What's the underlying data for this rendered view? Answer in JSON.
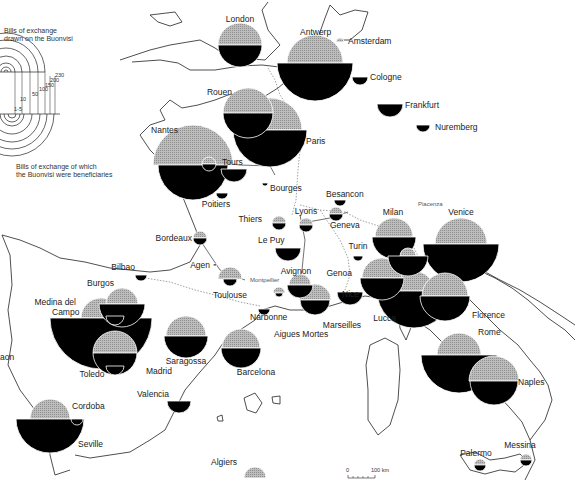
{
  "legend": {
    "top_title_line1": "Bills of exchange",
    "top_title_line2": "drawn on the Buonvisi",
    "bottom_title_line1": "Bills of exchange of which",
    "bottom_title_line2": "the Buonvisi were beneficiaries",
    "scale_values": [
      "1-5",
      "10",
      "50",
      "100",
      "150",
      "200",
      "230"
    ]
  },
  "scale_bar": {
    "start": "0",
    "end": "100 km"
  },
  "colors": {
    "drawn_on": "#a8a8a8",
    "beneficiaries": "#000000"
  },
  "cities": [
    {
      "name": "London",
      "x": 240,
      "y": 45,
      "drawn_r": 22,
      "benef_r": 22,
      "lx": 240,
      "ly": 22,
      "anchor": "middle"
    },
    {
      "name": "Antwerp",
      "x": 315,
      "y": 63,
      "drawn_r": 28,
      "benef_r": 38,
      "lx": 300,
      "ly": 35,
      "anchor": "start"
    },
    {
      "name": "Amsterdam",
      "x": 340,
      "y": 42,
      "drawn_r": 4,
      "benef_r": 0,
      "lx": 348,
      "ly": 44,
      "anchor": "start"
    },
    {
      "name": "Cologne",
      "x": 360,
      "y": 77,
      "drawn_r": 0,
      "benef_r": 8,
      "lx": 370,
      "ly": 80,
      "anchor": "start"
    },
    {
      "name": "Frankfurt",
      "x": 390,
      "y": 104,
      "drawn_r": 0,
      "benef_r": 13,
      "lx": 405,
      "ly": 108,
      "anchor": "start"
    },
    {
      "name": "Nuremberg",
      "x": 423,
      "y": 125,
      "drawn_r": 0,
      "benef_r": 7,
      "lx": 435,
      "ly": 130,
      "anchor": "start"
    },
    {
      "name": "Rouen",
      "x": 248,
      "y": 113,
      "drawn_r": 25,
      "benef_r": 25,
      "lx": 232,
      "ly": 95,
      "anchor": "end"
    },
    {
      "name": "Paris",
      "x": 270,
      "y": 130,
      "drawn_r": 32,
      "benef_r": 37,
      "lx": 306,
      "ly": 144,
      "anchor": "start"
    },
    {
      "name": "Nantes",
      "x": 193,
      "y": 165,
      "drawn_r": 40,
      "benef_r": 35,
      "lx": 178,
      "ly": 133,
      "anchor": "end"
    },
    {
      "name": "Tours",
      "x": 209,
      "y": 164,
      "drawn_r": 7,
      "benef_r": 7,
      "lx": 222,
      "ly": 165,
      "anchor": "start"
    },
    {
      "name": "Tours-2",
      "x": 234,
      "y": 169,
      "drawn_r": 0,
      "benef_r": 13,
      "lx": 0,
      "ly": 0,
      "anchor": "start"
    },
    {
      "name": "Poitiers",
      "x": 222,
      "y": 193,
      "drawn_r": 0,
      "benef_r": 6,
      "lx": 216,
      "ly": 207,
      "anchor": "middle"
    },
    {
      "name": "Bourges",
      "x": 265,
      "y": 183,
      "drawn_r": 0,
      "benef_r": 3,
      "lx": 270,
      "ly": 191,
      "anchor": "start"
    },
    {
      "name": "Besancon",
      "x": 340,
      "y": 200,
      "drawn_r": 0,
      "benef_r": 6,
      "lx": 326,
      "ly": 197,
      "anchor": "start"
    },
    {
      "name": "Thiers",
      "x": 279,
      "y": 223,
      "drawn_r": 7,
      "benef_r": 7,
      "lx": 262,
      "ly": 222,
      "anchor": "end"
    },
    {
      "name": "Lyons",
      "x": 306,
      "y": 225,
      "drawn_r": 7,
      "benef_r": 7,
      "lx": 306,
      "ly": 214,
      "anchor": "middle"
    },
    {
      "name": "Geneva",
      "x": 336,
      "y": 214,
      "drawn_r": 7,
      "benef_r": 7,
      "lx": 330,
      "ly": 228,
      "anchor": "start"
    },
    {
      "name": "Le Puy",
      "x": 288,
      "y": 248,
      "drawn_r": 0,
      "benef_r": 13,
      "lx": 258,
      "ly": 243,
      "anchor": "start"
    },
    {
      "name": "Bordeaux",
      "x": 200,
      "y": 238,
      "drawn_r": 7,
      "benef_r": 7,
      "lx": 192,
      "ly": 241,
      "anchor": "end"
    },
    {
      "name": "Agen",
      "x": 215,
      "y": 264,
      "drawn_r": 0,
      "benef_r": 2,
      "lx": 210,
      "ly": 268,
      "anchor": "end"
    },
    {
      "name": "Bilbao",
      "x": 141,
      "y": 275,
      "drawn_r": 0,
      "benef_r": 6,
      "lx": 135,
      "ly": 270,
      "anchor": "end"
    },
    {
      "name": "Toulouse",
      "x": 230,
      "y": 279,
      "drawn_r": 12,
      "benef_r": 7,
      "lx": 230,
      "ly": 298,
      "anchor": "middle"
    },
    {
      "name": "Montpellier",
      "x": 279,
      "y": 293,
      "drawn_r": 6,
      "benef_r": 4,
      "lx": 250,
      "ly": 282,
      "anchor": "start"
    },
    {
      "name": "Narbonne",
      "x": 264,
      "y": 309,
      "drawn_r": 0,
      "benef_r": 6,
      "lx": 250,
      "ly": 320,
      "anchor": "start"
    },
    {
      "name": "Avignon",
      "x": 300,
      "y": 285,
      "drawn_r": 11,
      "benef_r": 13,
      "lx": 296,
      "ly": 274,
      "anchor": "middle"
    },
    {
      "name": "Marseilles",
      "x": 315,
      "y": 300,
      "drawn_r": 16,
      "benef_r": 15,
      "lx": 342,
      "ly": 328,
      "anchor": "middle"
    },
    {
      "name": "Aigues Mortes",
      "x": 0,
      "y": 0,
      "drawn_r": 0,
      "benef_r": 0,
      "lx": 274,
      "ly": 337,
      "anchor": "start"
    },
    {
      "name": "Turin",
      "x": 358,
      "y": 256,
      "drawn_r": 0,
      "benef_r": 5,
      "lx": 358,
      "ly": 249,
      "anchor": "middle"
    },
    {
      "name": "Genoa",
      "x": 382,
      "y": 278,
      "drawn_r": 20,
      "benef_r": 22,
      "lx": 352,
      "ly": 276,
      "anchor": "end"
    },
    {
      "name": "Nice",
      "x": 350,
      "y": 292,
      "drawn_r": 0,
      "benef_r": 13,
      "lx": 342,
      "ly": 297,
      "anchor": "start"
    },
    {
      "name": "Milan",
      "x": 394,
      "y": 237,
      "drawn_r": 19,
      "benef_r": 22,
      "lx": 393,
      "ly": 215,
      "anchor": "middle"
    },
    {
      "name": "Piacenza",
      "x": 408,
      "y": 256,
      "drawn_r": 8,
      "benef_r": 20,
      "lx": 418,
      "ly": 206,
      "anchor": "start"
    },
    {
      "name": "Venice",
      "x": 461,
      "y": 244,
      "drawn_r": 26,
      "benef_r": 38,
      "lx": 461,
      "ly": 215,
      "anchor": "middle"
    },
    {
      "name": "Lucca",
      "x": 414,
      "y": 291,
      "drawn_r": 20,
      "benef_r": 37,
      "lx": 396,
      "ly": 321,
      "anchor": "end"
    },
    {
      "name": "Florence",
      "x": 445,
      "y": 296,
      "drawn_r": 23,
      "benef_r": 25,
      "lx": 472,
      "ly": 318,
      "anchor": "start"
    },
    {
      "name": "Rome",
      "x": 459,
      "y": 355,
      "drawn_r": 22,
      "benef_r": 38,
      "lx": 478,
      "ly": 335,
      "anchor": "start"
    },
    {
      "name": "Naples",
      "x": 494,
      "y": 381,
      "drawn_r": 25,
      "benef_r": 24,
      "lx": 518,
      "ly": 385,
      "anchor": "start"
    },
    {
      "name": "Palermo",
      "x": 480,
      "y": 465,
      "drawn_r": 6,
      "benef_r": 6,
      "lx": 476,
      "ly": 456,
      "anchor": "middle"
    },
    {
      "name": "Messina",
      "x": 526,
      "y": 460,
      "drawn_r": 6,
      "benef_r": 6,
      "lx": 520,
      "ly": 448,
      "anchor": "middle"
    },
    {
      "name": "Burgos",
      "x": 122,
      "y": 304,
      "drawn_r": 16,
      "benef_r": 23,
      "lx": 114,
      "ly": 286,
      "anchor": "end"
    },
    {
      "name": "Burgos-inner",
      "x": 115,
      "y": 316,
      "drawn_r": 0,
      "benef_r": 9,
      "lx": 0,
      "ly": 0,
      "anchor": "start"
    },
    {
      "name": "Medina del Campo",
      "x": 101,
      "y": 318,
      "drawn_r": 20,
      "benef_r": 51,
      "lx": 76,
      "ly": 315,
      "anchor": "end"
    },
    {
      "name": "Madrid",
      "x": 115,
      "y": 353,
      "drawn_r": 22,
      "benef_r": 22,
      "lx": 146,
      "ly": 374,
      "anchor": "start"
    },
    {
      "name": "Toledo",
      "x": 115,
      "y": 366,
      "drawn_r": 0,
      "benef_r": 9,
      "lx": 92,
      "ly": 377,
      "anchor": "middle"
    },
    {
      "name": "Saragossa",
      "x": 186,
      "y": 336,
      "drawn_r": 20,
      "benef_r": 22,
      "lx": 186,
      "ly": 364,
      "anchor": "middle"
    },
    {
      "name": "Barcelona",
      "x": 241,
      "y": 348,
      "drawn_r": 19,
      "benef_r": 20,
      "lx": 256,
      "ly": 375,
      "anchor": "middle"
    },
    {
      "name": "Valencia",
      "x": 179,
      "y": 401,
      "drawn_r": 0,
      "benef_r": 12,
      "lx": 169,
      "ly": 397,
      "anchor": "end"
    },
    {
      "name": "Cordoba",
      "x": 77,
      "y": 419,
      "drawn_r": 0,
      "benef_r": 6,
      "lx": 72,
      "ly": 409,
      "anchor": "start"
    },
    {
      "name": "Seville",
      "x": 50,
      "y": 419,
      "drawn_r": 20,
      "benef_r": 34,
      "lx": 78,
      "ly": 447,
      "anchor": "start"
    },
    {
      "name": "Algiers",
      "x": 255,
      "y": 478,
      "drawn_r": 11,
      "benef_r": 0,
      "lx": 224,
      "ly": 465,
      "anchor": "middle"
    },
    {
      "name": "Aragon-edge",
      "x": 0,
      "y": 0,
      "drawn_r": 0,
      "benef_r": 0,
      "lx": 0,
      "ly": 357,
      "anchor": "start"
    }
  ],
  "edge_label": "aon"
}
